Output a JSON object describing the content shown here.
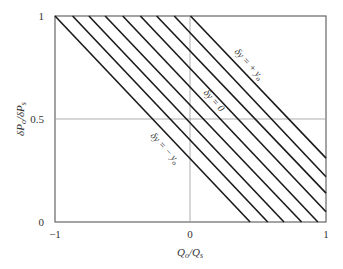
{
  "chart_data": {
    "type": "line",
    "title": "",
    "xlabel": "Q_o/Q_s",
    "ylabel": "δP_o/δP_s",
    "xlim": [
      -1,
      1
    ],
    "ylim": [
      0,
      1
    ],
    "xticks": [
      "-1",
      "0",
      "1"
    ],
    "yticks": [
      "0",
      "0.5",
      "1"
    ],
    "grid": "reference lines at x=0 and y=0.5",
    "series": [
      {
        "name": "line-1 (δy = -y_o)",
        "points": [
          [
            -1.0,
            1.0
          ],
          [
            0.44,
            0.0
          ]
        ]
      },
      {
        "name": "line-2",
        "points": [
          [
            -0.87,
            1.0
          ],
          [
            0.57,
            0.0
          ]
        ]
      },
      {
        "name": "line-3",
        "points": [
          [
            -0.75,
            1.0
          ],
          [
            0.69,
            0.0
          ]
        ]
      },
      {
        "name": "line-4",
        "points": [
          [
            -0.63,
            1.0
          ],
          [
            0.82,
            0.0
          ]
        ]
      },
      {
        "name": "line-5 (δy = 0)",
        "points": [
          [
            -0.5,
            1.0
          ],
          [
            0.94,
            0.0
          ]
        ]
      },
      {
        "name": "line-6",
        "points": [
          [
            -0.37,
            1.0
          ],
          [
            1.0,
            0.05
          ]
        ]
      },
      {
        "name": "line-7",
        "points": [
          [
            -0.25,
            1.0
          ],
          [
            1.0,
            0.14
          ]
        ]
      },
      {
        "name": "line-8",
        "points": [
          [
            -0.12,
            1.0
          ],
          [
            1.0,
            0.22
          ]
        ]
      },
      {
        "name": "line-9 (δy = +y_o)",
        "points": [
          [
            0.0,
            1.0
          ],
          [
            1.0,
            0.31
          ]
        ]
      }
    ],
    "annotations": [
      "δy = + y_o",
      "δy = 0",
      "δy = − y_o"
    ]
  },
  "axes": {
    "x_label_main": "Q",
    "x_label_sub_num": "o",
    "x_label_sep": "/",
    "x_label_den": "Q",
    "x_label_sub_den": "s",
    "y_label": "δP",
    "y_label_sub_num": "o",
    "y_label_sep": "/δP",
    "y_label_sub_den": "s",
    "x_ticks": [
      "−1",
      "0",
      "1"
    ],
    "y_ticks": [
      "0",
      "0.5",
      "1"
    ]
  },
  "labels": {
    "plus": "δy = + y",
    "plus_sub": "o",
    "zero": "δy = 0",
    "minus": "δy = − y",
    "minus_sub": "o"
  },
  "colors": {
    "line": "#1a1a1a",
    "axis": "#666666",
    "refline": "#999999"
  }
}
